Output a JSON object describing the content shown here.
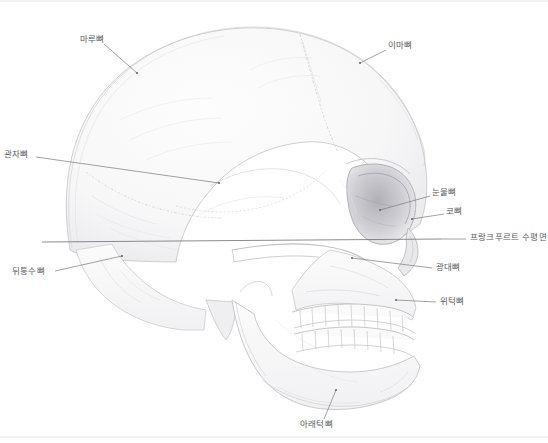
{
  "figure": {
    "medium": "pencil drawing",
    "background_color": "#ffffff",
    "label_color": "#5a5a5e",
    "leader_color": "#6f6f73",
    "sketch_color": "#b9b9bf",
    "border_color": "#e2e2e4",
    "width": 548,
    "height": 443
  },
  "labels": [
    {
      "id": "parietal-bone",
      "text": "마루뼈",
      "text_x": 80,
      "text_y": 40,
      "anchor": "left",
      "leader": {
        "x1": 104,
        "y1": 44,
        "x2": 137,
        "y2": 73
      },
      "dot": {
        "x": 137,
        "y": 73
      }
    },
    {
      "id": "frontal-bone",
      "text": "이마뼈",
      "text_x": 388,
      "text_y": 46,
      "anchor": "left",
      "leader": {
        "x1": 386,
        "y1": 50,
        "x2": 360,
        "y2": 63
      },
      "dot": {
        "x": 360,
        "y": 63
      }
    },
    {
      "id": "temporal-bone",
      "text": "관자뼈",
      "text_x": 4,
      "text_y": 155,
      "anchor": "left",
      "leader": {
        "x1": 36,
        "y1": 157,
        "x2": 219,
        "y2": 183
      },
      "dot": {
        "x": 219,
        "y": 183
      }
    },
    {
      "id": "lacrimal-bone",
      "text": "눈물뼈",
      "text_x": 432,
      "text_y": 193,
      "anchor": "left",
      "leader": {
        "x1": 430,
        "y1": 196,
        "x2": 380,
        "y2": 210
      },
      "dot": {
        "x": 380,
        "y": 210
      }
    },
    {
      "id": "nasal-bone",
      "text": "코뼈",
      "text_x": 446,
      "text_y": 212,
      "anchor": "left",
      "leader": {
        "x1": 444,
        "y1": 214,
        "x2": 412,
        "y2": 219
      },
      "dot": {
        "x": 412,
        "y": 219
      }
    },
    {
      "id": "frankfurt-horizontal-plane",
      "text": "프랑크푸르트 수평면",
      "text_x": 470,
      "text_y": 238,
      "anchor": "left",
      "leader": {
        "x1": 466,
        "y1": 239,
        "x2": 442,
        "y2": 239
      },
      "dot": null
    },
    {
      "id": "zygomatic-bone",
      "text": "광대뼈",
      "text_x": 436,
      "text_y": 268,
      "anchor": "left",
      "leader": {
        "x1": 432,
        "y1": 268,
        "x2": 352,
        "y2": 258
      },
      "dot": {
        "x": 352,
        "y": 258
      }
    },
    {
      "id": "maxilla",
      "text": "위턱뼈",
      "text_x": 440,
      "text_y": 302,
      "anchor": "left",
      "leader": {
        "x1": 436,
        "y1": 302,
        "x2": 396,
        "y2": 300
      },
      "dot": {
        "x": 396,
        "y": 300
      }
    },
    {
      "id": "occipital-bone",
      "text": "뒤통수뼈",
      "text_x": 12,
      "text_y": 272,
      "anchor": "left",
      "leader": {
        "x1": 55,
        "y1": 271,
        "x2": 122,
        "y2": 256
      },
      "dot": {
        "x": 122,
        "y": 256
      }
    },
    {
      "id": "mandible",
      "text": "아래턱뼈",
      "text_x": 300,
      "text_y": 425,
      "anchor": "left",
      "leader": {
        "x1": 324,
        "y1": 419,
        "x2": 336,
        "y2": 390
      },
      "dot": {
        "x": 336,
        "y": 390
      }
    }
  ],
  "reference_line": {
    "id": "frankfurt-plane-line",
    "label": "프랑크푸르트 수평면",
    "x1": 42,
    "y1": 242,
    "x2": 442,
    "y2": 239
  },
  "anatomy_regions": [
    {
      "id": "cranial-vault",
      "name": "머리덮개"
    },
    {
      "id": "orbit",
      "name": "눈확"
    },
    {
      "id": "nasal-aperture",
      "name": "코안"
    },
    {
      "id": "upper-teeth",
      "name": "위턱니"
    },
    {
      "id": "lower-teeth",
      "name": "아래턱니"
    },
    {
      "id": "zygomatic-arch",
      "name": "광대활"
    },
    {
      "id": "mastoid-process",
      "name": "꼭지돌기"
    },
    {
      "id": "coronal-suture",
      "name": "관상봉합"
    },
    {
      "id": "lambdoid-suture",
      "name": "시옷봉합"
    }
  ]
}
